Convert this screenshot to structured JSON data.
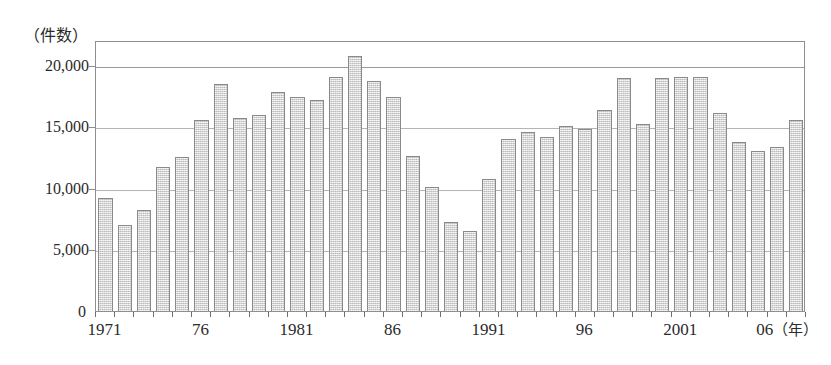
{
  "chart_data": {
    "type": "bar",
    "title": "",
    "subtitle": "",
    "xlabel": "年",
    "ylabel": "件数",
    "unit_caption": "（件数）",
    "year_suffix_label": "（年）",
    "ylim": [
      0,
      22000
    ],
    "y_axis_max_gridline": 20000,
    "grid": true,
    "legend": null,
    "y_ticks": [
      {
        "value": 20000,
        "label": "20,000"
      },
      {
        "value": 15000,
        "label": "15,000"
      },
      {
        "value": 10000,
        "label": "10,000"
      },
      {
        "value": 5000,
        "label": "5,000"
      },
      {
        "value": 0,
        "label": "0"
      }
    ],
    "x_tick_labels": [
      {
        "year": 1971,
        "label": "1971"
      },
      {
        "year": 1976,
        "label": "76"
      },
      {
        "year": 1981,
        "label": "1981"
      },
      {
        "year": 1986,
        "label": "86"
      },
      {
        "year": 1991,
        "label": "1991"
      },
      {
        "year": 1996,
        "label": "96"
      },
      {
        "year": 2001,
        "label": "2001"
      },
      {
        "year": 2006,
        "label": "06"
      }
    ],
    "categories": [
      1971,
      1972,
      1973,
      1974,
      1975,
      1976,
      1977,
      1978,
      1979,
      1980,
      1981,
      1982,
      1983,
      1984,
      1985,
      1986,
      1987,
      1988,
      1989,
      1990,
      1991,
      1992,
      1993,
      1994,
      1995,
      1996,
      1997,
      1998,
      1999,
      2000,
      2001,
      2002,
      2003,
      2004,
      2005,
      2006,
      2007
    ],
    "values": [
      9200,
      7000,
      8200,
      11700,
      12500,
      15500,
      18400,
      15700,
      15900,
      17800,
      17400,
      17100,
      19000,
      20700,
      18700,
      17400,
      12600,
      10100,
      7200,
      6500,
      10700,
      14000,
      14500,
      14100,
      15000,
      14800,
      16300,
      18900,
      15200,
      18900,
      19000,
      19000,
      16100,
      13700,
      13000,
      13300,
      15500
    ]
  },
  "style": {
    "bar_fill": "#dcdcdc",
    "bar_border": "#8a8a8a",
    "grid_color": "#9a9a9a",
    "frame_color": "#8e8e8e",
    "text_color": "#2b2b2b",
    "background": "#ffffff"
  }
}
